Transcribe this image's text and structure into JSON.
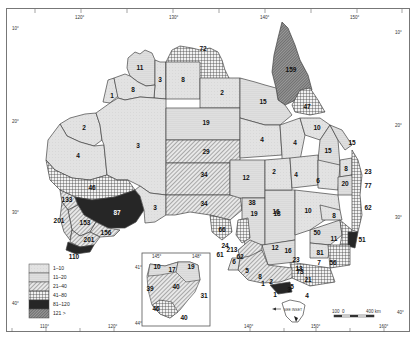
{
  "map": {
    "title": "",
    "longitude_ticks_top": [
      "120°",
      "130°",
      "140°",
      "150°"
    ],
    "longitude_ticks_bottom": [
      "110°",
      "120°",
      "140°",
      "150°",
      "160°"
    ],
    "latitude_ticks_left": [
      "10°",
      "20°",
      "30°",
      "40°"
    ],
    "latitude_ticks_right": [
      "10°",
      "20°",
      "30°",
      "40°"
    ],
    "inset_ticks": {
      "top": [
        "145°",
        "148°"
      ],
      "left": [
        "41°",
        "44°"
      ]
    },
    "scale_bar": {
      "left": "100",
      "zero": "0",
      "right": "400 km"
    },
    "tasmania_label": "SEE INSET",
    "colors": {
      "class1": "#dedede",
      "class2": "#d0d0d0",
      "class3": "#a8a8a8",
      "class4": "#8a8a8a",
      "class5": "#2a2a2a",
      "class6": "#6a6a6a",
      "border": "#444444"
    }
  },
  "legend": {
    "items": [
      {
        "label": "1–10",
        "pattern": "light"
      },
      {
        "label": "11–20",
        "pattern": "dots"
      },
      {
        "label": "21–40",
        "pattern": "hatch"
      },
      {
        "label": "41–80",
        "pattern": "crosshatch"
      },
      {
        "label": "81–120",
        "pattern": "dark"
      },
      {
        "label": "121 >",
        "pattern": "dense-hatch"
      }
    ]
  },
  "regions": {
    "wa_north": [
      "11",
      "1",
      "8",
      "3"
    ],
    "wa_mid": [
      "2",
      "4",
      "3"
    ],
    "wa_south": [
      "46",
      "133",
      "87",
      "201",
      "153",
      "156",
      "201",
      "110",
      "3"
    ],
    "nt": [
      "72",
      "8",
      "2",
      "19"
    ],
    "sa": [
      "29",
      "34",
      "34",
      "12",
      "66",
      "38",
      "19",
      "16"
    ],
    "qld": [
      "159",
      "15",
      "47",
      "4",
      "4",
      "10",
      "15",
      "15",
      "2",
      "4",
      "6",
      "8",
      "20",
      "23",
      "77",
      "62"
    ],
    "nsw": [
      "10",
      "8",
      "50",
      "11",
      "51",
      "81",
      "7",
      "56",
      "21",
      "13",
      "73",
      "12",
      "16",
      "18"
    ],
    "vic_sa_coast": [
      "24",
      "213",
      "61",
      "62",
      "6",
      "5",
      "8",
      "2",
      "1",
      "5",
      "3",
      "1",
      "4",
      "23"
    ],
    "tasmania_inset": [
      "10",
      "17",
      "19",
      "39",
      "40",
      "31",
      "46",
      "40"
    ]
  }
}
